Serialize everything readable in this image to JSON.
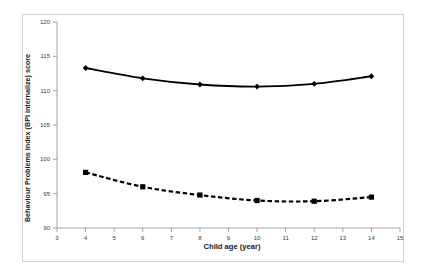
{
  "chart_data": {
    "type": "line",
    "title": "",
    "xlabel": "Child age (year)",
    "ylabel": "Behaviour Problems Index (BPI internalize) score",
    "xlim": [
      3,
      15
    ],
    "ylim": [
      90,
      120
    ],
    "xticks": [
      3,
      4,
      5,
      6,
      7,
      8,
      9,
      10,
      11,
      12,
      13,
      14,
      15
    ],
    "yticks": [
      90,
      95,
      100,
      105,
      110,
      115,
      120
    ],
    "grid": false,
    "legend": "none",
    "x": [
      4,
      6,
      8,
      10,
      12,
      14
    ],
    "series": [
      {
        "name": "solid-diamond-series",
        "line_style": "solid",
        "marker": "diamond",
        "color": "#000000",
        "values": [
          113.3,
          111.8,
          110.9,
          110.6,
          111.0,
          112.1
        ]
      },
      {
        "name": "dashed-square-series",
        "line_style": "dashed",
        "marker": "square",
        "color": "#000000",
        "values": [
          98.1,
          96.0,
          94.8,
          94.0,
          93.9,
          94.5
        ]
      }
    ]
  },
  "axis": {
    "y_tick_labels": [
      "120",
      "115",
      "110",
      "105",
      "100",
      "95",
      "90"
    ],
    "x_tick_labels": [
      "3",
      "4",
      "5",
      "6",
      "7",
      "8",
      "9",
      "10",
      "11",
      "12",
      "13",
      "14",
      "15"
    ],
    "y_title": "Behaviour Problems Index (BPI internalize) score",
    "x_title": "Child age (year)"
  },
  "colors": {
    "axis_line": "#9a9a9a",
    "frame": "#d2d2d2",
    "series_1": "#000000",
    "series_2": "#000000",
    "background": "#ffffff",
    "tick_text": "#3a3a3a",
    "title_text": "#1a1a1a"
  }
}
